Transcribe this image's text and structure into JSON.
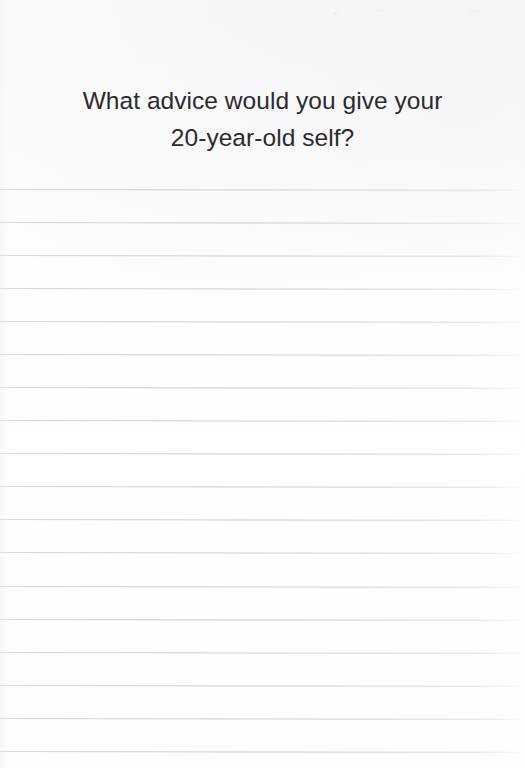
{
  "page": {
    "kind": "lined-journal-page",
    "width": 525,
    "height": 768,
    "background_color": "#fdfdfd"
  },
  "heading": {
    "text": "What advice would you give your\n20-year-old self?",
    "lines": [
      "What advice would you give your",
      "20-year-old self?"
    ],
    "color": "#2b2b2d",
    "font_size_px": 24.5,
    "align": "center"
  },
  "ruled_area": {
    "line_color": "#d2d2d8",
    "line_count": 18,
    "first_line_y": 189,
    "line_spacing_px": 33,
    "line_left_x": 0,
    "line_width_px": 519,
    "lines_y": [
      189,
      222,
      255,
      288,
      321,
      354,
      387,
      420,
      453,
      486,
      519,
      552,
      586,
      619,
      652,
      685,
      718,
      751
    ]
  },
  "writing_lines": [
    {
      "index": 1,
      "content": ""
    },
    {
      "index": 2,
      "content": ""
    },
    {
      "index": 3,
      "content": ""
    },
    {
      "index": 4,
      "content": ""
    },
    {
      "index": 5,
      "content": ""
    },
    {
      "index": 6,
      "content": ""
    },
    {
      "index": 7,
      "content": ""
    },
    {
      "index": 8,
      "content": ""
    },
    {
      "index": 9,
      "content": ""
    },
    {
      "index": 10,
      "content": ""
    },
    {
      "index": 11,
      "content": ""
    },
    {
      "index": 12,
      "content": ""
    },
    {
      "index": 13,
      "content": ""
    },
    {
      "index": 14,
      "content": ""
    },
    {
      "index": 15,
      "content": ""
    },
    {
      "index": 16,
      "content": ""
    },
    {
      "index": 17,
      "content": ""
    },
    {
      "index": 18,
      "content": ""
    }
  ]
}
